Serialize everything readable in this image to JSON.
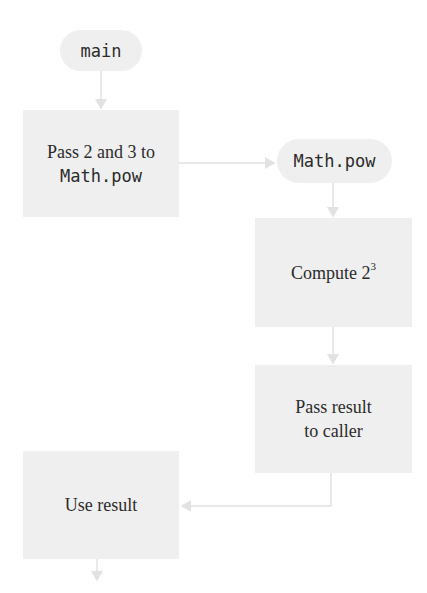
{
  "diagram": {
    "nodes": [
      {
        "id": "main",
        "shape": "pill",
        "label": "main"
      },
      {
        "id": "pass-args",
        "shape": "box",
        "line1": "Pass 2 and 3 to",
        "line2": "Math.pow"
      },
      {
        "id": "math-pow",
        "shape": "pill",
        "label": "Math.pow"
      },
      {
        "id": "compute",
        "shape": "box",
        "label": "Compute 2",
        "superscript": "3"
      },
      {
        "id": "pass-result",
        "shape": "box",
        "line1": "Pass result",
        "line2": "to caller"
      },
      {
        "id": "use-result",
        "shape": "box",
        "label": "Use result"
      }
    ],
    "edges": [
      {
        "from": "main",
        "to": "pass-args"
      },
      {
        "from": "pass-args",
        "to": "math-pow"
      },
      {
        "from": "math-pow",
        "to": "compute"
      },
      {
        "from": "compute",
        "to": "pass-result"
      },
      {
        "from": "pass-result",
        "to": "use-result"
      },
      {
        "from": "use-result",
        "to": "continuation"
      }
    ],
    "colors": {
      "node_fill": "#efefef",
      "connector": "#e2e2e2",
      "text": "#2b2b2b"
    }
  }
}
